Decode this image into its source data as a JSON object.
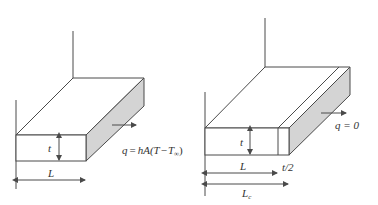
{
  "colors": {
    "line": "#4a4a4a",
    "shade": "#d4d4d4",
    "text": "#333333",
    "background": "#ffffff"
  },
  "left_fin": {
    "thickness_label": "t",
    "length_label": "L",
    "heat_flux_equation": "q = hA(T − T∞)",
    "eq_q": "q",
    "eq_equals": "=",
    "eq_rhs": "hA(T",
    "eq_minus": "−",
    "eq_T": "T",
    "eq_sub": "∞",
    "eq_close": ")"
  },
  "right_fin": {
    "thickness_label": "t",
    "length_label": "L",
    "extension_label": "t/2",
    "corrected_length_label": "L",
    "corrected_length_sub": "c",
    "heat_flux_equation": "q = 0"
  }
}
